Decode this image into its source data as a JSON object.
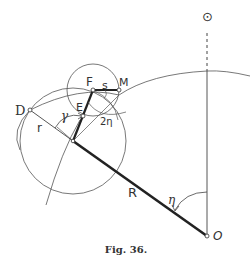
{
  "figure": {
    "caption": "Fig. 36.",
    "labels": {
      "sun_symbol": "⊙",
      "D": "D",
      "E": "E",
      "F": "F",
      "M": "M",
      "s": "s",
      "r": "r",
      "gamma": "γ",
      "two_eta": "2η",
      "R": "R",
      "eta": "η",
      "O": "O"
    },
    "colors": {
      "line": "#333333",
      "thin_line": "#555555"
    }
  }
}
